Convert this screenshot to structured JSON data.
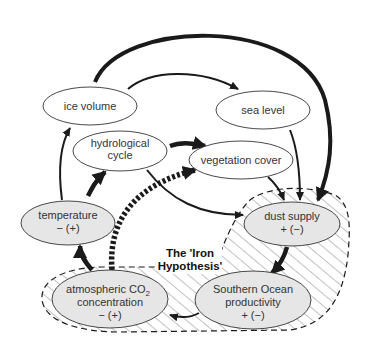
{
  "diagram": {
    "title": "The 'Iron Hypothesis'",
    "title_lines": [
      "The 'Iron",
      "Hypothesis'"
    ],
    "colors": {
      "node_fill_plain": "#ffffff",
      "node_fill_iron": "#e6e6e6",
      "stroke": "#1a1a1a",
      "hatch": "#555555"
    },
    "nodes": {
      "ice_volume": {
        "lines": [
          "ice volume"
        ]
      },
      "hydrological_cycle": {
        "lines": [
          "hydrological",
          "cycle"
        ]
      },
      "sea_level": {
        "lines": [
          "sea level"
        ]
      },
      "vegetation_cover": {
        "lines": [
          "vegetation cover"
        ]
      },
      "temperature": {
        "lines": [
          "temperature",
          "− (+)"
        ]
      },
      "dust_supply": {
        "lines": [
          "dust supply",
          "+ (−)"
        ]
      },
      "co2": {
        "line1": "atmospheric CO",
        "line1_sub": "2",
        "lines": [
          "concentration",
          "− (+)"
        ]
      },
      "southern_ocean": {
        "lines": [
          "Southern Ocean",
          "productivity",
          "+ (−)"
        ]
      }
    },
    "edges": [
      {
        "from": "ice volume",
        "to": "sea level",
        "style": "medium"
      },
      {
        "from": "ice volume",
        "to": "dust supply",
        "style": "thick"
      },
      {
        "from": "temperature",
        "to": "ice volume",
        "style": "medium"
      },
      {
        "from": "temperature",
        "to": "hydrological cycle",
        "style": "thick"
      },
      {
        "from": "hydrological cycle",
        "to": "vegetation cover",
        "style": "thick"
      },
      {
        "from": "hydrological cycle",
        "to": "dust supply",
        "style": "medium"
      },
      {
        "from": "sea level",
        "to": "dust supply",
        "style": "medium"
      },
      {
        "from": "vegetation cover",
        "to": "dust supply",
        "style": "medium"
      },
      {
        "from": "atmospheric CO2 concentration",
        "to": "vegetation cover",
        "style": "dotted-thick"
      },
      {
        "from": "atmospheric CO2 concentration",
        "to": "temperature",
        "style": "thick"
      },
      {
        "from": "dust supply",
        "to": "Southern Ocean productivity",
        "style": "thick"
      },
      {
        "from": "Southern Ocean productivity",
        "to": "atmospheric CO2 concentration",
        "style": "medium"
      }
    ]
  }
}
